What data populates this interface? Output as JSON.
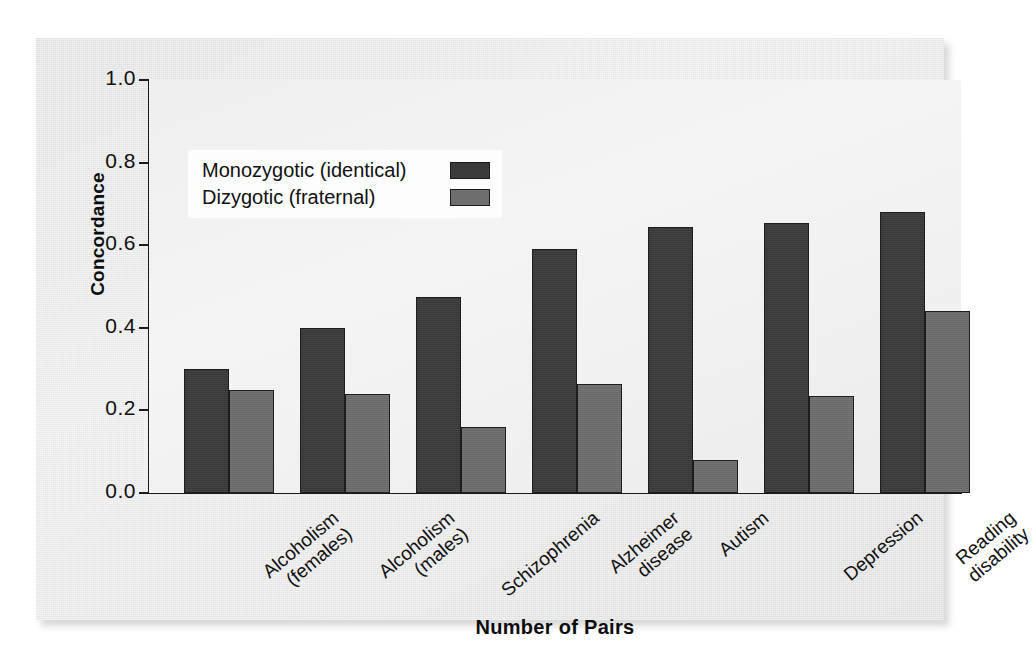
{
  "chart_data": {
    "type": "bar",
    "title": "",
    "xlabel": "Number of Pairs",
    "ylabel": "Concordance",
    "ylim": [
      0.0,
      1.0
    ],
    "yticks": [
      "0.0",
      "0.2",
      "0.4",
      "0.6",
      "0.8",
      "1.0"
    ],
    "ytick_values": [
      0.0,
      0.2,
      0.4,
      0.6,
      0.8,
      1.0
    ],
    "grid": false,
    "legend_position": "upper-left-inside",
    "categories": [
      "Alcoholism\n(females)",
      "Alcoholism\n(males)",
      "Schizophrenia",
      "Alzheimer\ndisease",
      "Autism",
      "Depression",
      "Reading\ndisability"
    ],
    "series": [
      {
        "name": "Monozygotic (identical)",
        "color": "#3b3b3b",
        "values": [
          0.3,
          0.4,
          0.475,
          0.59,
          0.645,
          0.655,
          0.68
        ]
      },
      {
        "name": "Dizygotic (fraternal)",
        "color": "#6e6e6e",
        "values": [
          0.25,
          0.24,
          0.16,
          0.265,
          0.08,
          0.235,
          0.44
        ]
      }
    ]
  },
  "legend": {
    "items": [
      {
        "label": "Monozygotic (identical)",
        "swatch": "mz"
      },
      {
        "label": "Dizygotic (fraternal)",
        "swatch": "dz"
      }
    ]
  },
  "axes": {
    "y_title": "Concordance",
    "x_title": "Number of Pairs"
  },
  "colors": {
    "monozygotic": "#3b3b3b",
    "dizygotic": "#6e6e6e",
    "axis": "#1b1b1b",
    "panel": "#e8e8e8",
    "plot_bg": "#f1f1f1",
    "legend_bg": "#fdfdfd"
  }
}
